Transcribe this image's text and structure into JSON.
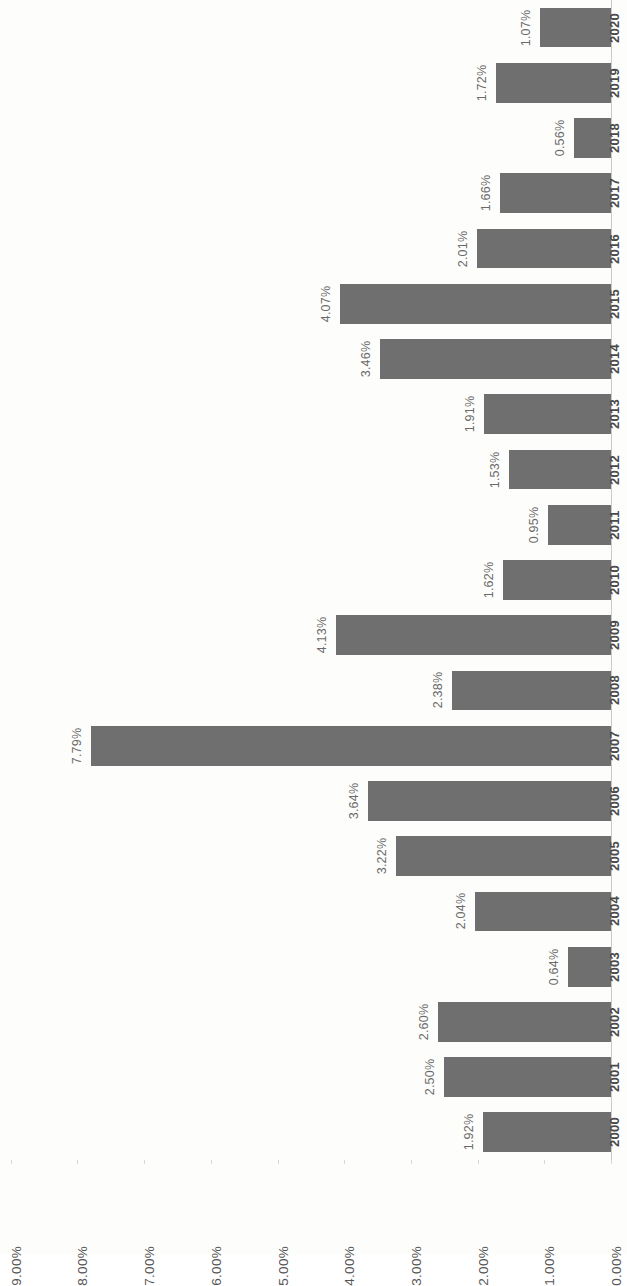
{
  "chart_data": {
    "type": "bar",
    "orientation": "horizontal",
    "title": "",
    "subtitle": "",
    "xlabel": "",
    "ylabel": "",
    "categories": [
      "2000",
      "2001",
      "2002",
      "2003",
      "2004",
      "2005",
      "2006",
      "2007",
      "2008",
      "2009",
      "2010",
      "2011",
      "2012",
      "2013",
      "2014",
      "2015",
      "2016",
      "2017",
      "2018",
      "2019",
      "2020"
    ],
    "values": [
      1.92,
      2.5,
      2.6,
      0.64,
      2.04,
      3.22,
      3.64,
      7.79,
      2.38,
      4.13,
      1.62,
      0.95,
      1.53,
      1.91,
      3.46,
      4.07,
      2.01,
      1.66,
      0.56,
      1.72,
      1.07
    ],
    "data_labels": [
      "1.92%",
      "2.50%",
      "2.60%",
      "0.64%",
      "2.04%",
      "3.22%",
      "3.64%",
      "7.79%",
      "2.38%",
      "4.13%",
      "1.62%",
      "0.95%",
      "1.53%",
      "1.91%",
      "3.46%",
      "4.07%",
      "2.01%",
      "1.66%",
      "0.56%",
      "1.72%",
      "1.07%"
    ],
    "tick_labels": [
      "9.00%",
      "8.00%",
      "7.00%",
      "6.00%",
      "5.00%",
      "4.00%",
      "3.00%",
      "2.00%",
      "1.00%",
      "0.00%"
    ],
    "tick_values": [
      9,
      8,
      7,
      6,
      5,
      4,
      3,
      2,
      1,
      0
    ],
    "xlim": [
      0,
      9
    ],
    "grid": false,
    "legend": false,
    "legend_position": "none",
    "bar_color": "#6f6f6f",
    "text_color": "#555555",
    "background_color": "#fdfdfc",
    "rotation": "chart rendered rotated 90 degrees (landscape chart on portrait page)"
  }
}
